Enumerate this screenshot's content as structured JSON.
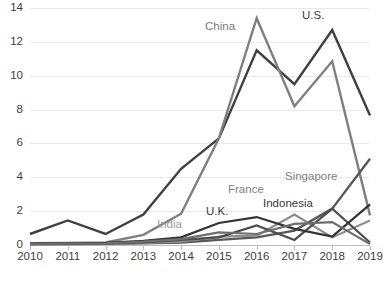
{
  "chart_data": {
    "type": "line",
    "title": "",
    "xlabel": "",
    "ylabel": "",
    "x": [
      2010,
      2011,
      2012,
      2013,
      2014,
      2015,
      2016,
      2017,
      2018,
      2019
    ],
    "xtick_labels": [
      "2010",
      "2011",
      "2012",
      "2013",
      "2014",
      "2015",
      "2016",
      "2017",
      "2018",
      "2019"
    ],
    "ytick_labels": [
      "0",
      "2",
      "4",
      "6",
      "8",
      "10",
      "12",
      "14"
    ],
    "yticks": [
      0,
      2,
      4,
      6,
      8,
      10,
      12,
      14
    ],
    "ylim": [
      0,
      14
    ],
    "xlim": [
      2010,
      2019
    ],
    "grid": "horizontal",
    "legend": "inline-annotations",
    "series": [
      {
        "name": "U.S.",
        "color": "#404040",
        "width": 2.4,
        "values": [
          0.65,
          1.45,
          0.65,
          1.8,
          4.5,
          6.3,
          11.5,
          9.5,
          12.7,
          7.65
        ]
      },
      {
        "name": "China",
        "color": "#7f7f7f",
        "width": 2.4,
        "values": [
          0.1,
          0.12,
          0.15,
          0.6,
          1.85,
          6.3,
          13.4,
          8.2,
          10.85,
          1.75
        ]
      },
      {
        "name": "Singapore",
        "color": "#595959",
        "width": 2.4,
        "values": [
          0.05,
          0.06,
          0.07,
          0.1,
          0.15,
          0.3,
          0.45,
          0.85,
          2.15,
          5.1
        ]
      },
      {
        "name": "France",
        "color": "#8c8c8c",
        "width": 2.2,
        "values": [
          0.05,
          0.06,
          0.08,
          0.12,
          0.2,
          0.5,
          0.55,
          1.8,
          0.45,
          1.45
        ]
      },
      {
        "name": "Indonesia",
        "color": "#4d4d4d",
        "width": 2.2,
        "values": [
          0.05,
          0.07,
          0.09,
          0.15,
          0.3,
          0.45,
          1.15,
          0.3,
          2.15,
          0.15
        ]
      },
      {
        "name": "U.K.",
        "color": "#333333",
        "width": 2.2,
        "values": [
          0.08,
          0.1,
          0.12,
          0.25,
          0.45,
          1.3,
          1.65,
          0.95,
          0.5,
          2.4
        ]
      },
      {
        "name": "India",
        "color": "#6e6e6e",
        "width": 2.2,
        "values": [
          0.06,
          0.08,
          0.1,
          0.2,
          0.35,
          0.75,
          0.65,
          1.25,
          1.35,
          0.05
        ]
      }
    ],
    "annotations": [
      {
        "label": "China",
        "x": 205,
        "y": 20,
        "color": "#7a7a7a"
      },
      {
        "label": "U.S.",
        "x": 302,
        "y": 9,
        "color": "#3a3a3a"
      },
      {
        "label": "Singapore",
        "x": 285,
        "y": 170,
        "color": "#808080"
      },
      {
        "label": "France",
        "x": 228,
        "y": 183,
        "color": "#808080"
      },
      {
        "label": "Indonesia",
        "x": 263,
        "y": 197,
        "color": "#3a3a3a"
      },
      {
        "label": "U.K.",
        "x": 206,
        "y": 205,
        "color": "#3a3a3a"
      },
      {
        "label": "India",
        "x": 157,
        "y": 218,
        "color": "#9a9a9a"
      }
    ]
  }
}
